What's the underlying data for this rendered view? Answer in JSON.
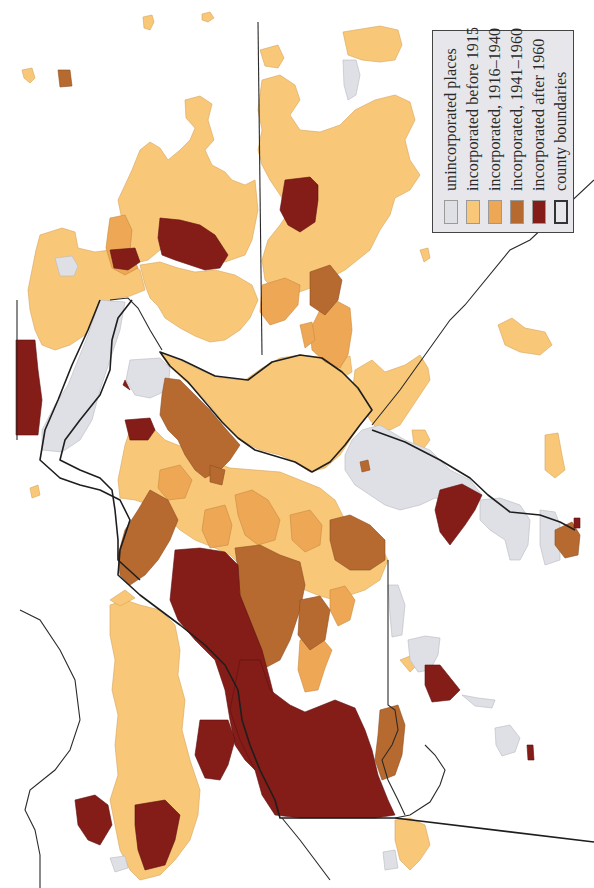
{
  "map": {
    "type": "choropleth",
    "subject": "Municipal incorporation by period",
    "colors": {
      "unincorporated": "#dfe0e6",
      "before_1915": "#f8c878",
      "1916_1940": "#eea855",
      "1941_1960": "#b66a30",
      "after_1960": "#841c18",
      "county_boundary": "#1e1e1e",
      "background": "#ffffff"
    }
  },
  "legend": {
    "items": [
      {
        "label": "unincorporated places",
        "color": "#dfe0e6",
        "kind": "fill"
      },
      {
        "label": "incorporated before 1915",
        "color": "#f8c878",
        "kind": "fill"
      },
      {
        "label": "incorporated, 1916–1940",
        "color": "#eea855",
        "kind": "fill"
      },
      {
        "label": "incorporated, 1941–1960",
        "color": "#b66a30",
        "kind": "fill"
      },
      {
        "label": "incorporated after 1960",
        "color": "#841c18",
        "kind": "fill"
      },
      {
        "label": "county boundaries",
        "color": "#333333",
        "kind": "outline"
      }
    ]
  }
}
